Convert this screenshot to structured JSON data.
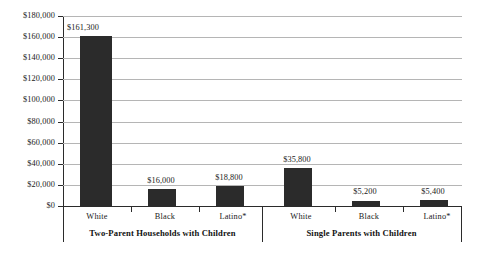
{
  "chart_data": {
    "type": "bar",
    "title": "",
    "subtitle": "",
    "xlabel": "",
    "ylabel": "",
    "ylim": [
      0,
      180000
    ],
    "grid": true,
    "legend": "none",
    "y_ticks": [
      "$0",
      "$20,000",
      "$40,000",
      "$60,000",
      "$80,000",
      "$100,000",
      "$120,000",
      "$140,000",
      "$160,000",
      "$180,000"
    ],
    "y_tick_values": [
      0,
      20000,
      40000,
      60000,
      80000,
      100000,
      120000,
      140000,
      160000,
      180000
    ],
    "categories": [
      "White",
      "Black",
      "Latino*"
    ],
    "groups": [
      {
        "label": "Two-Parent Households with Children",
        "bars": [
          {
            "category": "White",
            "value": 161300,
            "value_label": "$161,300"
          },
          {
            "category": "Black",
            "value": 16000,
            "value_label": "$16,000"
          },
          {
            "category": "Latino*",
            "value": 18800,
            "value_label": "$18,800"
          }
        ]
      },
      {
        "label": "Single Parents with Children",
        "bars": [
          {
            "category": "White",
            "value": 35800,
            "value_label": "$35,800"
          },
          {
            "category": "Black",
            "value": 5200,
            "value_label": "$5,200"
          },
          {
            "category": "Latino*",
            "value": 5400,
            "value_label": "$5,400"
          }
        ]
      }
    ],
    "colors": {
      "bar": "#2b2b2b",
      "gridline": "#b5b5b5",
      "axis": "#2b2b2b",
      "text": "#1a1a1a",
      "background": "#ffffff"
    }
  }
}
